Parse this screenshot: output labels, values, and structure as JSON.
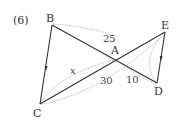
{
  "problem_label": "(6)",
  "points": {
    "B": "B",
    "E": "E",
    "A": "A",
    "C": "C",
    "D": "D"
  },
  "segments": [
    {
      "from": "B",
      "to": "C",
      "parallel_mark": true
    },
    {
      "from": "E",
      "to": "D",
      "parallel_mark": true
    },
    {
      "from": "B",
      "to": "D"
    },
    {
      "from": "C",
      "to": "E"
    }
  ],
  "measures": {
    "BA": "25",
    "CA": "x",
    "AE_below": "30",
    "AD": "10"
  },
  "colors": {
    "line": "#333333",
    "dotted": "#9a9a9a"
  }
}
